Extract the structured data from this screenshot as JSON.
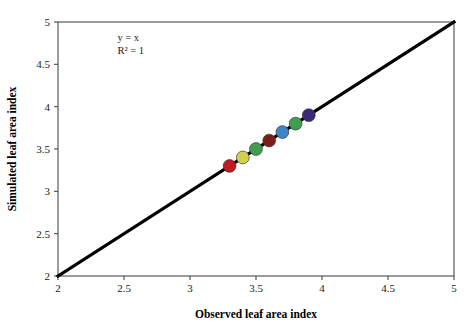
{
  "chart_data": {
    "type": "scatter",
    "title": "",
    "xlabel": "Observed leaf area index",
    "ylabel": "Simulated leaf area index",
    "xlim": [
      2,
      5
    ],
    "ylim": [
      2,
      5
    ],
    "xticks": [
      "2",
      "2.5",
      "3",
      "3.5",
      "4",
      "4.5",
      "5"
    ],
    "yticks": [
      "2",
      "2.5",
      "3",
      "3.5",
      "4",
      "4.5",
      "5"
    ],
    "xtick_values": [
      2,
      2.5,
      3,
      3.5,
      4,
      4.5,
      5
    ],
    "ytick_values": [
      2,
      2.5,
      3,
      3.5,
      4,
      4.5,
      5
    ],
    "grid": false,
    "legend": "none",
    "annotations": [
      {
        "text": "y = x",
        "x": 2.45,
        "y": 4.78
      },
      {
        "text": "R² = 1",
        "x": 2.45,
        "y": 4.62
      }
    ],
    "reference_line": {
      "name": "1:1 line",
      "equation": "y = x",
      "r_squared": "1",
      "from": [
        2,
        2
      ],
      "to": [
        5,
        5
      ],
      "color": "#000000"
    },
    "x": [
      3.3,
      3.4,
      3.5,
      3.6,
      3.7,
      3.8,
      3.9
    ],
    "y": [
      3.3,
      3.4,
      3.5,
      3.6,
      3.7,
      3.8,
      3.9
    ],
    "points": [
      {
        "x": 3.3,
        "y": 3.3,
        "color": "#c0191e"
      },
      {
        "x": 3.4,
        "y": 3.4,
        "color": "#cfd24a"
      },
      {
        "x": 3.5,
        "y": 3.5,
        "color": "#3f9e52"
      },
      {
        "x": 3.6,
        "y": 3.6,
        "color": "#7b1d18"
      },
      {
        "x": 3.7,
        "y": 3.7,
        "color": "#3b85c8"
      },
      {
        "x": 3.8,
        "y": 3.8,
        "color": "#3f9e52"
      },
      {
        "x": 3.9,
        "y": 3.9,
        "color": "#3b2878"
      }
    ],
    "marker_radius": 6.4,
    "marker_edge_color": "#3a3a3a"
  },
  "plot_box": {
    "left": 58,
    "right": 454,
    "top": 22,
    "bottom": 276,
    "frame_color": "#4a4a4a"
  }
}
